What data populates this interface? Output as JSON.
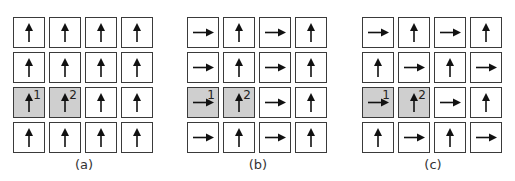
{
  "figure": {
    "panels": [
      {
        "label": "(a)",
        "rows": [
          [
            "up",
            "up",
            "up",
            "up"
          ],
          [
            "up",
            "up",
            "up",
            "up"
          ],
          [
            "up",
            "up",
            "up",
            "up"
          ],
          [
            "up",
            "up",
            "up",
            "up"
          ]
        ]
      },
      {
        "label": "(b)",
        "rows": [
          [
            "right",
            "up",
            "right",
            "up"
          ],
          [
            "right",
            "up",
            "right",
            "up"
          ],
          [
            "right",
            "up",
            "right",
            "up"
          ],
          [
            "right",
            "up",
            "right",
            "up"
          ]
        ]
      },
      {
        "label": "(c)",
        "rows": [
          [
            "right",
            "up",
            "right",
            "up"
          ],
          [
            "up",
            "right",
            "up",
            "right"
          ],
          [
            "right",
            "up",
            "right",
            "up"
          ],
          [
            "up",
            "right",
            "up",
            "right"
          ]
        ]
      }
    ],
    "highlighted_cells": [
      {
        "row": 2,
        "col": 0,
        "index_label": "1"
      },
      {
        "row": 2,
        "col": 1,
        "index_label": "2"
      }
    ],
    "colors": {
      "cell_border": "#3a3a3a",
      "highlight_fill": "#cfcfcf",
      "arrow": "#111111"
    }
  }
}
